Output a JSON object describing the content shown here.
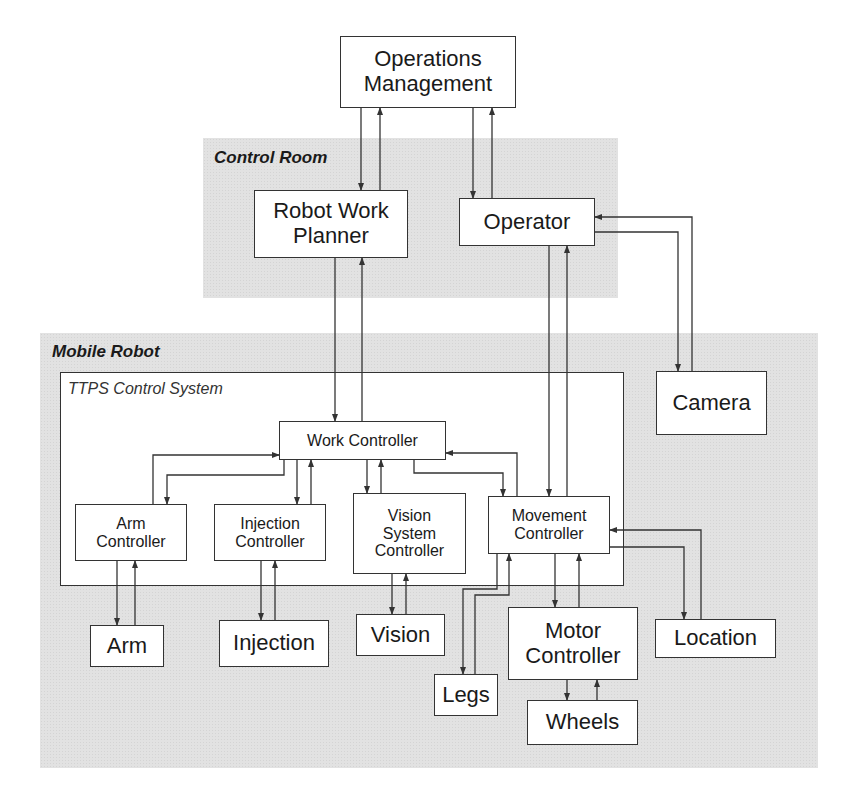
{
  "regions": {
    "control_room": {
      "label": "Control Room"
    },
    "mobile_robot": {
      "label": "Mobile Robot"
    }
  },
  "system": {
    "label": "TTPS Control System"
  },
  "nodes": {
    "operations_management": "Operations\nManagement",
    "robot_work_planner": "Robot Work\nPlanner",
    "operator": "Operator",
    "camera": "Camera",
    "work_controller": "Work Controller",
    "arm_controller": "Arm\nController",
    "injection_controller": "Injection\nController",
    "vision_system_controller": "Vision\nSystem\nController",
    "movement_controller": "Movement\nController",
    "arm": "Arm",
    "injection": "Injection",
    "vision": "Vision",
    "legs": "Legs",
    "motor_controller": "Motor\nController",
    "wheels": "Wheels",
    "location": "Location"
  },
  "colors": {
    "region_fill": "#e2e2e2",
    "box_fill": "#ffffff",
    "line": "#333333"
  }
}
